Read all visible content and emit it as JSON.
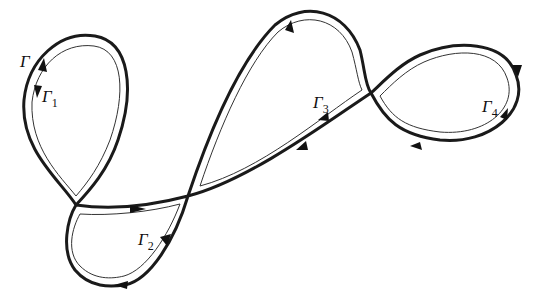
{
  "diagram": {
    "labels": {
      "gamma": {
        "main": "Γ",
        "sub": ""
      },
      "gamma1": {
        "main": "Γ",
        "sub": "1"
      },
      "gamma2": {
        "main": "Γ",
        "sub": "2"
      },
      "gamma3": {
        "main": "Γ",
        "sub": "3"
      },
      "gamma4": {
        "main": "Γ",
        "sub": "4"
      }
    },
    "crossings": [
      [
        76,
        205
      ],
      [
        188,
        196
      ],
      [
        371,
        93
      ]
    ],
    "colors": {
      "stroke": "#1a1a1a",
      "background": "#ffffff"
    }
  }
}
